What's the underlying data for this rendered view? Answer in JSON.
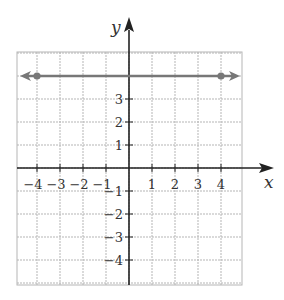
{
  "chart_data": {
    "type": "line",
    "title": "",
    "xlabel": "x",
    "ylabel": "y",
    "xlim": [
      -4.5,
      5.5
    ],
    "ylim": [
      -5,
      5
    ],
    "grid": true,
    "x_ticks": [
      -4,
      -3,
      -2,
      -1,
      1,
      2,
      3,
      4
    ],
    "y_ticks": [
      -4,
      -3,
      -2,
      -1,
      1,
      2,
      3
    ],
    "x_tick_labels": [
      "−4",
      "−3",
      "−2",
      "−1",
      "1",
      "2",
      "3",
      "4"
    ],
    "y_tick_labels": [
      "−4",
      "−3",
      "−2",
      "−1",
      "1",
      "2",
      "3"
    ],
    "series": [
      {
        "name": "y = 4",
        "equation": "y = 4",
        "points": [
          {
            "x": -4,
            "y": 4
          },
          {
            "x": 4,
            "y": 4
          }
        ],
        "arrows": "both",
        "color": "#777777"
      }
    ],
    "colors": {
      "grid": "#b5b5b5",
      "axes": "#222222",
      "line": "#777777",
      "text": "#333333"
    }
  }
}
